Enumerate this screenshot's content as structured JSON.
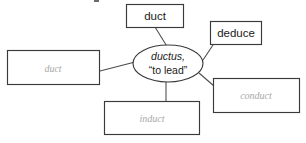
{
  "diagram": {
    "type": "word-web",
    "center": {
      "root_word": "ductus,",
      "gloss": "“to lead”",
      "shape": "ellipse"
    },
    "nodes": [
      {
        "id": "node-duct-top",
        "label": "duct",
        "state": "filled",
        "text_color": "#1a1a1a",
        "position": "top"
      },
      {
        "id": "node-deduce",
        "label": "deduce",
        "state": "filled",
        "text_color": "#1a1a1a",
        "position": "top-right"
      },
      {
        "id": "node-conduct",
        "label": "conduct",
        "state": "ghost",
        "text_color": "#a8a8a8",
        "position": "bottom-right"
      },
      {
        "id": "node-induct",
        "label": "induct",
        "state": "ghost",
        "text_color": "#a8a8a8",
        "position": "bottom"
      },
      {
        "id": "node-duct-left",
        "label": "duct",
        "state": "ghost",
        "text_color": "#a8a8a8",
        "position": "left"
      }
    ],
    "colors": {
      "stroke": "#3a3a3a",
      "connector": "#4a4a4a",
      "background": "#ffffff",
      "ghost_text": "#a8a8a8",
      "filled_text": "#1a1a1a"
    }
  }
}
